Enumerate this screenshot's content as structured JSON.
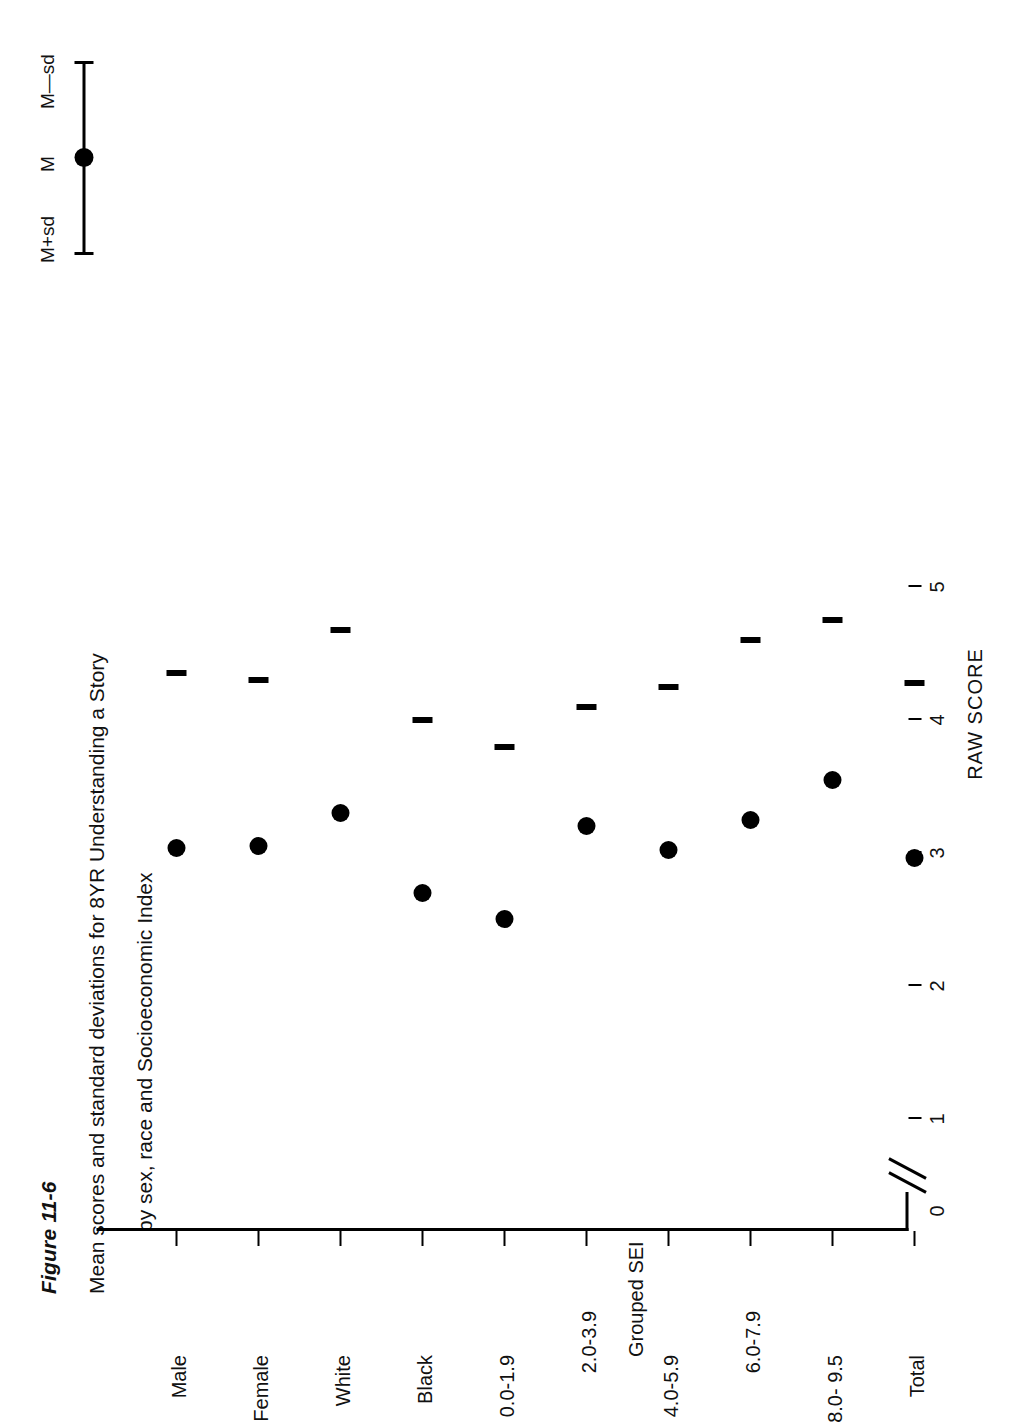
{
  "figure": {
    "number": "Figure 11-6",
    "caption_line1": "Mean scores and standard deviations for 8YR Understanding a Story",
    "caption_line2": "by sex, race and Socioeconomic Index"
  },
  "legend": {
    "upper_label": "M+sd",
    "mean_label": "M",
    "lower_label": "M—sd"
  },
  "axes": {
    "value_axis_title": "RAW SCORE",
    "category_axis_title": "Grouped SEI",
    "value_ticks": [
      "0",
      "1",
      "2",
      "3",
      "4",
      "5"
    ],
    "axis_break": true
  },
  "chart_data": {
    "type": "scatter",
    "title": "Mean scores and standard deviations for 8YR Understanding a Story by sex, race and Socioeconomic Index",
    "xlabel": "Grouped SEI",
    "ylabel": "RAW SCORE",
    "ylim": [
      0,
      5.4
    ],
    "grid": false,
    "legend_position": "top-right",
    "orientation": "horizontal-error-bars",
    "categories": [
      "Male",
      "Female",
      "White",
      "Black",
      "0.0-1.9",
      "2.0-3.9",
      "4.0-5.9",
      "6.0-7.9",
      "8.0- 9.5",
      "Total"
    ],
    "series": [
      {
        "name": "M",
        "values": [
          3.04,
          3.05,
          3.3,
          2.7,
          2.5,
          3.2,
          3.02,
          3.25,
          3.55,
          2.96
        ]
      },
      {
        "name": "M+sd",
        "values": [
          4.35,
          4.3,
          4.68,
          4.0,
          3.8,
          4.1,
          4.25,
          4.6,
          4.75,
          4.28
        ]
      },
      {
        "name": "M—sd",
        "values": [
          1.72,
          1.72,
          2.02,
          1.4,
          1.1,
          1.55,
          1.72,
          2.05,
          2.32,
          1.68
        ]
      }
    ]
  }
}
